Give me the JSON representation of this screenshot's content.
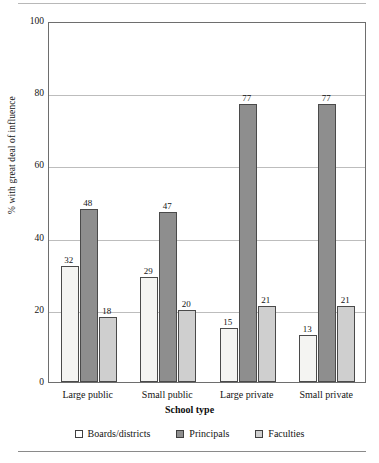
{
  "chart_data": {
    "type": "bar",
    "title": "",
    "xlabel": "School type",
    "ylabel": "% with great deal of influence",
    "categories": [
      "Large public",
      "Small public",
      "Large private",
      "Small private"
    ],
    "series": [
      {
        "name": "Boards/districts",
        "values": [
          32,
          29,
          15,
          13
        ],
        "color": "#f4f4f2"
      },
      {
        "name": "Principals",
        "values": [
          48,
          47,
          77,
          77
        ],
        "color": "#8e8e8e"
      },
      {
        "name": "Faculties",
        "values": [
          18,
          20,
          21,
          21
        ],
        "color": "#cfcfcf"
      }
    ],
    "ylim": [
      0,
      100
    ],
    "yticks": [
      0,
      20,
      40,
      60,
      80,
      100
    ],
    "ytick_labels": [
      "0",
      "20",
      "40",
      "60",
      "80",
      "100"
    ],
    "grid": true,
    "grid_axis": "y",
    "legend_position": "bottom",
    "data_labels": true
  },
  "legend": {
    "items": [
      {
        "label": "Boards/districts",
        "swatch": "series-0-swatch"
      },
      {
        "label": "Principals",
        "swatch": "series-1-swatch"
      },
      {
        "label": "Faculties",
        "swatch": "series-2-swatch"
      }
    ]
  },
  "colors": {
    "series_0": "#f4f4f2",
    "series_1": "#8e8e8e",
    "series_2": "#cfcfcf",
    "axis": "#6e6e6e",
    "gridline": "#bdbdbd",
    "text": "#141414",
    "rule": "#b8b8b8"
  }
}
